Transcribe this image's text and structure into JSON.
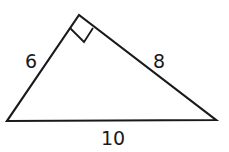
{
  "diagram": {
    "type": "right-triangle",
    "stroke_color": "#1a1a1a",
    "vertices": {
      "top": [
        79,
        15
      ],
      "bottom_left": [
        7,
        121
      ],
      "bottom_right": [
        216,
        120
      ]
    },
    "right_angle_at": "top",
    "sides": [
      {
        "name": "left",
        "label": "6"
      },
      {
        "name": "right",
        "label": "8"
      },
      {
        "name": "base",
        "label": "10"
      }
    ]
  }
}
